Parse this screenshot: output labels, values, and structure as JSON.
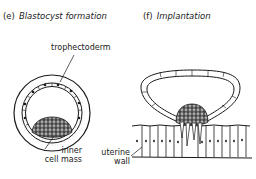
{
  "panels": [
    {
      "letter": "(e)",
      "title": "Blastocyst formation",
      "labels": {
        "trophectoderm": "trophectoderm",
        "inner_cell_mass_line1": "inner",
        "inner_cell_mass_line2": "cell mass"
      }
    },
    {
      "letter": "(f)",
      "title": "Implantation",
      "labels": {
        "uterine_wall_line1": "uterine",
        "uterine_wall_line2": "wall"
      }
    }
  ],
  "colors": {
    "ink": "#1a1a1a",
    "background": "#ffffff",
    "stipple": "#9a9a9a"
  }
}
